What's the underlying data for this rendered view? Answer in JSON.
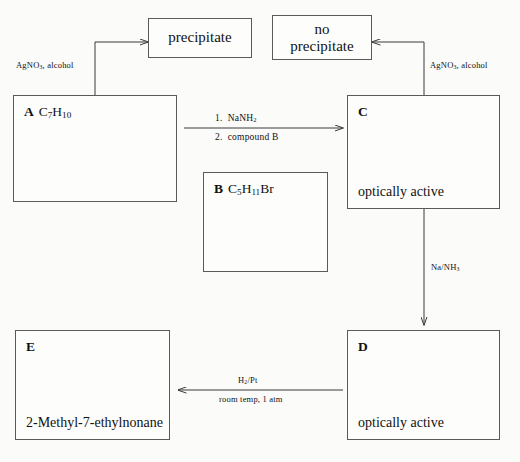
{
  "diagram": {
    "boxes": {
      "precipitate": {
        "text": "precipitate"
      },
      "no_precipitate": {
        "line1": "no",
        "line2": "precipitate"
      },
      "a": {
        "tag": "A",
        "formula_c": "C",
        "formula_sub1": "7",
        "formula_h": "H",
        "formula_sub2": "10"
      },
      "b": {
        "tag": "B",
        "formula_c": "C",
        "formula_sub1": "5",
        "formula_h": "H",
        "formula_sub2": "11",
        "formula_br": "Br"
      },
      "c": {
        "tag": "C",
        "note": "optically active"
      },
      "d": {
        "tag": "D",
        "note": "optically active"
      },
      "e": {
        "tag": "E",
        "name": "2-Methyl-7-ethylnonane"
      }
    },
    "conditions": {
      "agno3_left": {
        "text": "AgNO",
        "sub": "3",
        "tail": ", alcohol"
      },
      "agno3_right": {
        "text": "AgNO",
        "sub": "3",
        "tail": ", alcohol"
      },
      "a_to_c_step1": {
        "prefix": "1.",
        "reagent": "NaNH",
        "sub": "2"
      },
      "a_to_c_step2": {
        "prefix": "2.",
        "reagent": "compound B"
      },
      "c_to_d": {
        "text": "Na/NH",
        "sub": "3"
      },
      "d_to_e_top": {
        "text": "H",
        "sub": "2",
        "tail": "/Pt"
      },
      "d_to_e_bottom": {
        "text": "room temp, 1 atm"
      }
    },
    "colors": {
      "background": "#fbfbfa",
      "box_border": "#5a5a5a",
      "line": "#3a3a3a",
      "text": "#111111"
    }
  }
}
